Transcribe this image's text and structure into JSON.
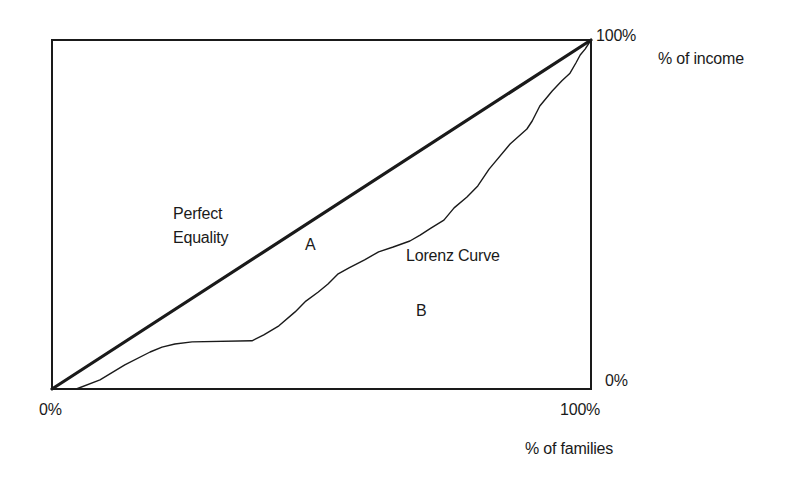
{
  "chart_data": {
    "type": "line",
    "title": "",
    "xlabel": "% of families",
    "ylabel": "% of income",
    "x_ticks": [
      "0%",
      "100%"
    ],
    "y_ticks": [
      "0%",
      "100%"
    ],
    "xlim": [
      0,
      100
    ],
    "ylim": [
      0,
      100
    ],
    "grid": false,
    "legend": null,
    "series": [
      {
        "name": "Perfect Equality",
        "style": "thick straight line",
        "x": [
          0,
          100
        ],
        "y": [
          0,
          100
        ]
      },
      {
        "name": "Lorenz Curve",
        "style": "thin jagged line",
        "x": [
          0,
          4.5,
          8.9,
          13.5,
          18.2,
          20.4,
          22.8,
          26.0,
          37.1,
          39.3,
          42.1,
          45.1,
          47.1,
          49.4,
          51.2,
          53.1,
          55.1,
          58.0,
          60.6,
          63.3,
          66.4,
          68.3,
          70.3,
          72.7,
          74.6,
          77.0,
          79.0,
          81.1,
          85.0,
          88.1,
          89.1,
          90.5,
          92.8,
          94.6,
          96.1,
          97.2,
          98.0,
          98.9,
          100
        ],
        "y": [
          0,
          0,
          2.6,
          6.9,
          10.6,
          12.0,
          12.9,
          13.5,
          13.8,
          15.5,
          18.1,
          22.1,
          25.2,
          27.8,
          30.1,
          33.0,
          34.7,
          37.0,
          39.3,
          40.7,
          42.4,
          44.1,
          46.1,
          48.4,
          51.9,
          55.0,
          58.2,
          63.0,
          70.2,
          74.5,
          76.8,
          81.1,
          85.4,
          88.3,
          90.5,
          93.4,
          95.7,
          97.4,
          100
        ]
      }
    ],
    "annotations": [
      {
        "text": "Perfect Equality",
        "near": "diagonal line, left-center"
      },
      {
        "text": "A",
        "region": "between equality line and Lorenz curve"
      },
      {
        "text": "Lorenz Curve",
        "near": "curve, center-right"
      },
      {
        "text": "B",
        "region": "below Lorenz curve"
      }
    ]
  },
  "labels": {
    "y_top": "100%",
    "y_axis_title": "% of income",
    "y_bottom": "0%",
    "x_left": "0%",
    "x_right": "100%",
    "x_axis_title": "% of families",
    "equality_line1": "Perfect",
    "equality_line2": "Equality",
    "area_a": "A",
    "lorenz": "Lorenz Curve",
    "area_b": "B"
  },
  "colors": {
    "ink": "#1a1a1a",
    "background": "#ffffff"
  }
}
